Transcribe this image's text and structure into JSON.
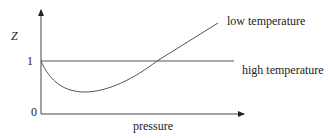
{
  "diagram": {
    "y_axis_label": "Z",
    "x_axis_label": "pressure",
    "y_ticks": [
      "1",
      "0"
    ],
    "curves": [
      {
        "label": "low temperature",
        "shape": "dips below 1 to a minimum then rises above 1"
      },
      {
        "label": "high temperature",
        "shape": "horizontal at Z = 1"
      }
    ],
    "colors": {
      "line": "#555555",
      "text": "#222222"
    }
  }
}
